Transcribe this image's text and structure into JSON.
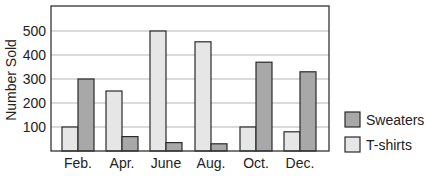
{
  "chart_data": {
    "type": "bar",
    "title": "",
    "xlabel": "",
    "ylabel": "Number Sold",
    "ylim": [
      0,
      600
    ],
    "yticks": [
      100,
      200,
      300,
      400,
      500
    ],
    "grid": true,
    "legend_position": "right",
    "categories": [
      "Feb.",
      "Apr.",
      "June",
      "Aug.",
      "Oct.",
      "Dec."
    ],
    "series": [
      {
        "name": "T-shirts",
        "color": "#e6e6e6",
        "values": [
          100,
          250,
          500,
          455,
          100,
          80
        ]
      },
      {
        "name": "Sweaters",
        "color": "#a8a8a8",
        "values": [
          300,
          60,
          35,
          30,
          370,
          330
        ]
      }
    ]
  },
  "legend": {
    "items": [
      {
        "label": "Sweaters",
        "color": "#a8a8a8"
      },
      {
        "label": "T-shirts",
        "color": "#e6e6e6"
      }
    ]
  }
}
